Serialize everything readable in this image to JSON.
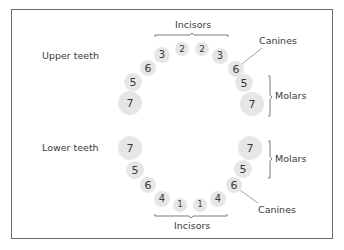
{
  "diagram": {
    "labels": {
      "upper_teeth": "Upper teeth",
      "lower_teeth": "Lower teeth",
      "incisors_top": "Incisors",
      "incisors_bottom": "Incisors",
      "canines_upper": "Canines",
      "canines_lower": "Canines",
      "molars_upper": "Molars",
      "molars_lower": "Molars"
    },
    "upper_teeth": [
      {
        "num": "7",
        "x": 130,
        "y": 103,
        "r": 12,
        "fs": 11
      },
      {
        "num": "5",
        "x": 133,
        "y": 82,
        "r": 9,
        "fs": 11
      },
      {
        "num": "6",
        "x": 148,
        "y": 68,
        "r": 8,
        "fs": 11
      },
      {
        "num": "3",
        "x": 162,
        "y": 55,
        "r": 8,
        "fs": 10
      },
      {
        "num": "2",
        "x": 182,
        "y": 49,
        "r": 7,
        "fs": 9
      },
      {
        "num": "2",
        "x": 202,
        "y": 49,
        "r": 7,
        "fs": 9
      },
      {
        "num": "3",
        "x": 220,
        "y": 56,
        "r": 8,
        "fs": 10
      },
      {
        "num": "6",
        "x": 236,
        "y": 69,
        "r": 8,
        "fs": 11
      },
      {
        "num": "5",
        "x": 244,
        "y": 83,
        "r": 9,
        "fs": 11
      },
      {
        "num": "7",
        "x": 252,
        "y": 104,
        "r": 12,
        "fs": 11
      }
    ],
    "lower_teeth": [
      {
        "num": "7",
        "x": 130,
        "y": 148,
        "r": 12,
        "fs": 11
      },
      {
        "num": "5",
        "x": 135,
        "y": 170,
        "r": 9,
        "fs": 11
      },
      {
        "num": "6",
        "x": 148,
        "y": 185,
        "r": 8,
        "fs": 11
      },
      {
        "num": "4",
        "x": 162,
        "y": 199,
        "r": 8,
        "fs": 10
      },
      {
        "num": "1",
        "x": 180,
        "y": 205,
        "r": 7,
        "fs": 8
      },
      {
        "num": "1",
        "x": 200,
        "y": 205,
        "r": 7,
        "fs": 8
      },
      {
        "num": "4",
        "x": 218,
        "y": 199,
        "r": 8,
        "fs": 10
      },
      {
        "num": "6",
        "x": 234,
        "y": 185,
        "r": 8,
        "fs": 11
      },
      {
        "num": "5",
        "x": 243,
        "y": 169,
        "r": 9,
        "fs": 11
      },
      {
        "num": "7",
        "x": 250,
        "y": 148,
        "r": 12,
        "fs": 11
      }
    ],
    "colors": {
      "tooth_fill": "#e6e6e6",
      "text": "#3a3a3a",
      "frame": "#6a6a6a",
      "lines": "#7a7a7a"
    }
  }
}
